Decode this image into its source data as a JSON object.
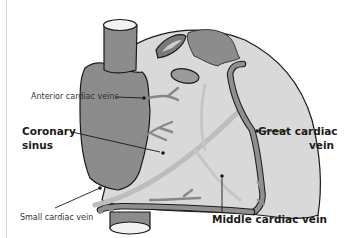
{
  "diagram": {
    "colors": {
      "background": "#ffffff",
      "heart_fill": "#d9d9d9",
      "atrium_fill": "#8c8c8c",
      "vein_fill": "#8f8f8f",
      "outline": "#1a1a1a",
      "vessel_opening": "#f2f2f2",
      "faint_artery": "#bdbdbd"
    },
    "labels": {
      "anterior_cardiac_veins": "Anterior cardiac veins",
      "coronary_sinus_line1": "Coronary",
      "coronary_sinus_line2": "sinus",
      "great_cardiac_vein_line1": "Great cardiac",
      "great_cardiac_vein_line2": "vein",
      "small_cardiac_vein": "Small cardiac vein",
      "middle_cardiac_vein": "Middle cardiac vein"
    }
  }
}
